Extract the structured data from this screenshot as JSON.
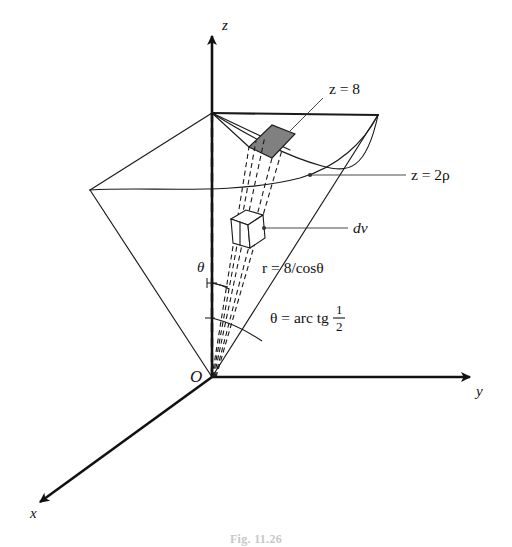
{
  "figure": {
    "kind": "3d-coordinate-diagram",
    "caption": "Fig. 11.26",
    "background_color": "#ffffff",
    "line_color": "#1a1a1a",
    "shaded_patch_color": "#808080"
  },
  "axes": [
    {
      "id": "z",
      "label": "z",
      "direction": "up"
    },
    {
      "id": "y",
      "label": "y",
      "direction": "right"
    },
    {
      "id": "x",
      "label": "x",
      "direction": "down-left"
    }
  ],
  "origin": {
    "label": "O"
  },
  "labels": {
    "plane": "z = 8",
    "cone": "z = 2ρ",
    "volume_element": "dv",
    "radius": "r = 8/cosθ",
    "angle_symbol": "θ",
    "half_angle_prefix": "θ = arc tg",
    "half_angle_numerator": "1",
    "half_angle_denominator": "2"
  },
  "annotations": [
    {
      "name": "plane-label",
      "text": "z = 8"
    },
    {
      "name": "cone-label",
      "text": "z = 2ρ"
    },
    {
      "name": "dv-label",
      "text": "dv"
    },
    {
      "name": "radius-label",
      "text": "r = 8/cosθ"
    },
    {
      "name": "theta-label",
      "text": "θ"
    },
    {
      "name": "half-angle-label",
      "text": "θ = arc tg 1/2"
    }
  ]
}
